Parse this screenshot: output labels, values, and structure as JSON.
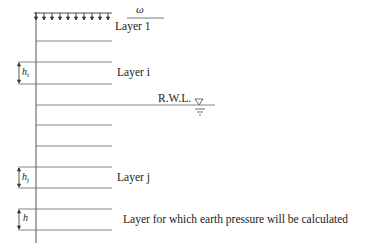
{
  "diagram": {
    "surcharge": {
      "symbol": "ω"
    },
    "layers": [
      {
        "name": "layer-1",
        "label": "Layer 1"
      },
      {
        "name": "layer-i",
        "label": "Layer i",
        "thickness_symbol": "h",
        "thickness_sub": "i"
      },
      {
        "name": "layer-j",
        "label": "Layer j",
        "thickness_symbol": "h",
        "thickness_sub": "j"
      },
      {
        "name": "layer-target",
        "label": "Layer for which earth pressure will be calculated",
        "thickness_symbol": "h"
      }
    ],
    "water_level": {
      "label": "R.W.L."
    },
    "colors": {
      "line": "#555555",
      "text": "#222222"
    }
  }
}
